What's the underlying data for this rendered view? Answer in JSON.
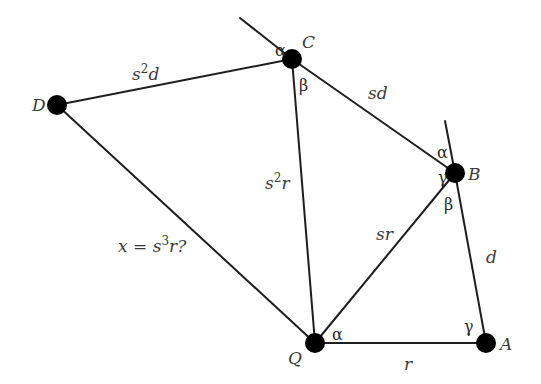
{
  "points": [
    {
      "name": "D",
      "x": 57,
      "y": 105,
      "label_x": 32,
      "label_y": 111
    },
    {
      "name": "C",
      "x": 292,
      "y": 59,
      "label_x": 302,
      "label_y": 48
    },
    {
      "name": "B",
      "x": 455,
      "y": 173,
      "label_x": 468,
      "label_y": 180
    },
    {
      "name": "Q",
      "x": 315,
      "y": 343,
      "label_x": 288,
      "label_y": 364
    },
    {
      "name": "A",
      "x": 486,
      "y": 343,
      "label_x": 500,
      "label_y": 350
    }
  ],
  "edges": [
    {
      "from": "D",
      "to": "C",
      "label": "s²d",
      "label_base": "s",
      "label_sup": "2",
      "label_tail": "d",
      "lx": 132,
      "ly": 80
    },
    {
      "from": "D",
      "to": "Q",
      "label": "x = s³r?",
      "label_base": "x = s",
      "label_sup": "3",
      "label_tail": "r?",
      "lx": 118,
      "ly": 252
    },
    {
      "from": "C",
      "to": "Q",
      "label": "s²r",
      "label_base": "s",
      "label_sup": "2",
      "label_tail": "r",
      "lx": 265,
      "ly": 189
    },
    {
      "from": "C",
      "to": "B",
      "label": "sd",
      "label_base": "sd",
      "label_sup": "",
      "label_tail": "",
      "lx": 368,
      "ly": 99
    },
    {
      "from": "Q",
      "to": "B",
      "label": "sr",
      "label_base": "sr",
      "label_sup": "",
      "label_tail": "",
      "lx": 376,
      "ly": 240
    },
    {
      "from": "B",
      "to": "A",
      "label": "d",
      "label_base": "d",
      "label_sup": "",
      "label_tail": "",
      "lx": 486,
      "ly": 263
    },
    {
      "from": "Q",
      "to": "A",
      "label": "r",
      "label_base": "r",
      "label_sup": "",
      "label_tail": "",
      "lx": 404,
      "ly": 370
    }
  ],
  "extension_lines": [
    {
      "through": "C",
      "x1": 240,
      "y1": 18,
      "x2": 292,
      "y2": 59
    },
    {
      "through": "B",
      "x1": 445,
      "y1": 121,
      "x2": 455,
      "y2": 173
    }
  ],
  "angles": [
    {
      "symbol": "α",
      "at": "C",
      "x": 275,
      "y": 56
    },
    {
      "symbol": "β",
      "at": "C",
      "x": 299,
      "y": 91
    },
    {
      "symbol": "α",
      "at": "B",
      "x": 437,
      "y": 158
    },
    {
      "symbol": "γ",
      "at": "B",
      "x": 438,
      "y": 183
    },
    {
      "symbol": "β",
      "at": "B",
      "x": 444,
      "y": 210
    },
    {
      "symbol": "α",
      "at": "Q",
      "x": 332,
      "y": 340
    },
    {
      "symbol": "γ",
      "at": "A",
      "x": 464,
      "y": 332
    }
  ]
}
